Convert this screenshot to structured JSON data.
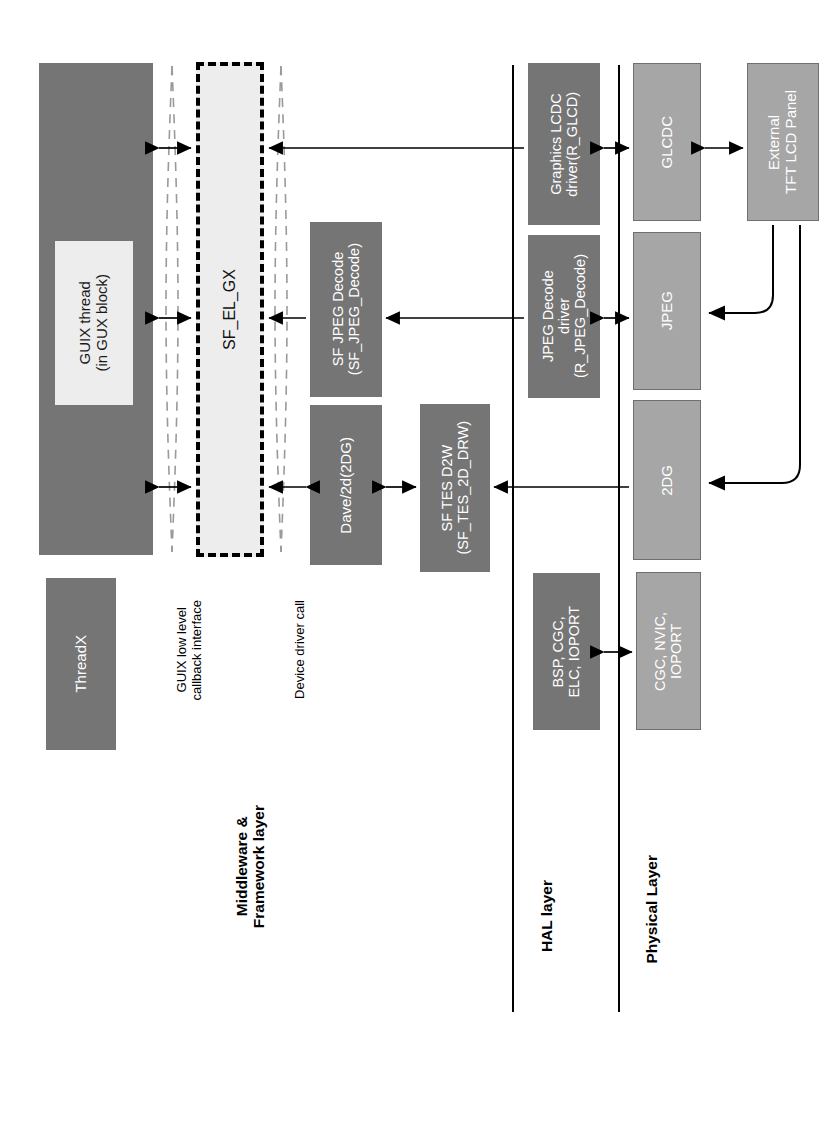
{
  "diagram": {
    "colors": {
      "dark_block": "#757575",
      "mid_block": "#a6a6a6",
      "light_block": "#ededed",
      "line": "#000000",
      "background": "#ffffff"
    },
    "layer_labels": [
      {
        "id": "middleware",
        "text": "Middleware &\nFramework layer"
      },
      {
        "id": "hal",
        "text": "HAL layer"
      },
      {
        "id": "physical",
        "text": "Physical Layer"
      }
    ],
    "interface_labels": [
      {
        "id": "guix-callback",
        "text": "GUIX low level\ncallback interface"
      },
      {
        "id": "device-driver-call",
        "text": "Device driver call"
      }
    ],
    "blocks": [
      {
        "id": "guix",
        "label": "GUIX",
        "style": "dark"
      },
      {
        "id": "guix-thread",
        "label": "GUIX thread\n(in GUX block)",
        "style": "light"
      },
      {
        "id": "sf-el-gx",
        "label": "SF_EL_GX",
        "style": "dashed"
      },
      {
        "id": "threadx",
        "label": "ThreadX",
        "style": "dark"
      },
      {
        "id": "sf-jpeg-decode",
        "label": "SF JPEG Decode\n(SF_JPEG_Decode)",
        "style": "dark"
      },
      {
        "id": "dave2d",
        "label": "Dave/2d(2DG)",
        "style": "dark"
      },
      {
        "id": "sf-tes-d2w",
        "label": "SF TES D2W\n(SF_TES_2D_DRW)",
        "style": "dark"
      },
      {
        "id": "graphics-lcdc",
        "label": "Graphics LCDC\ndriver(R_GLCD)",
        "style": "dark"
      },
      {
        "id": "jpeg-decode-drv",
        "label": "JPEG Decode\ndriver\n(R_JPEG_Decode)",
        "style": "dark"
      },
      {
        "id": "bsp-cgc-elc",
        "label": "BSP, CGC,\nELC, IOPORT",
        "style": "dark"
      },
      {
        "id": "glcdc",
        "label": "GLCDC",
        "style": "mid"
      },
      {
        "id": "jpeg",
        "label": "JPEG",
        "style": "mid"
      },
      {
        "id": "2dg",
        "label": "2DG",
        "style": "mid"
      },
      {
        "id": "cgc-nvic",
        "label": "CGC, NVIC,\nIOPORT",
        "style": "mid"
      },
      {
        "id": "tft-panel",
        "label": "External\nTFT LCD Panel",
        "style": "mid"
      }
    ]
  }
}
